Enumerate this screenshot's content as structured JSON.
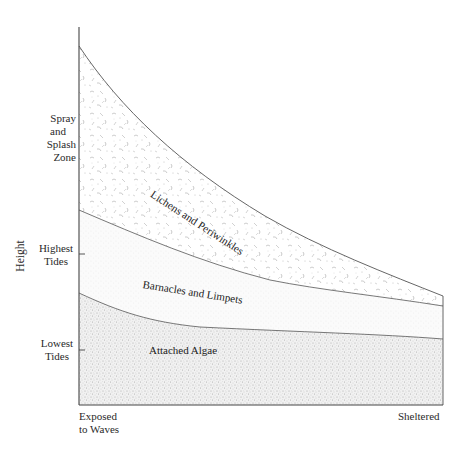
{
  "diagram": {
    "title": "",
    "y_axis_label": "Height",
    "y_levels": [
      {
        "label_line1": "Spray",
        "label_line2": "and",
        "label_line3": "Splash",
        "label_line4": "Zone"
      },
      {
        "label_line1": "Highest",
        "label_line2": "Tides"
      },
      {
        "label_line1": "Lowest",
        "label_line2": "Tides"
      }
    ],
    "x_axis": {
      "left_label_line1": "Exposed",
      "left_label_line2": "to Waves",
      "right_label": "Sheltered"
    },
    "zones": [
      {
        "name": "Lichens and Periwinkles",
        "texture": "squiggle"
      },
      {
        "name": "Barnacles and Limpets",
        "texture": "fine-dots"
      },
      {
        "name": "Attached Algae",
        "texture": "dense-stipple"
      }
    ],
    "colors": {
      "line": "#555555",
      "text": "#2a2a2a",
      "background": "#ffffff"
    }
  }
}
